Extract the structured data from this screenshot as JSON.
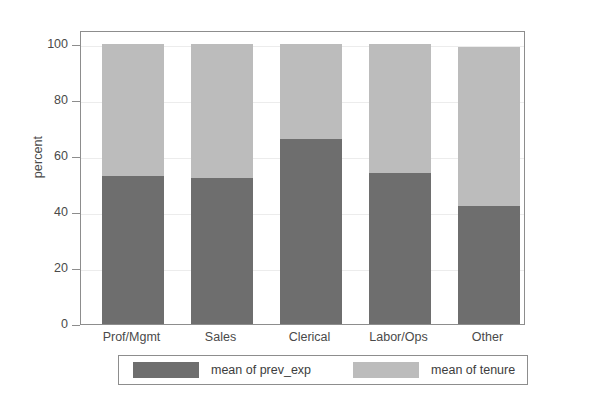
{
  "chart_data": {
    "type": "bar",
    "subtype": "stacked-percentage",
    "title": "",
    "xlabel": "",
    "ylabel": "percent",
    "ylim": [
      0,
      100
    ],
    "yticks": [
      0,
      20,
      40,
      60,
      80,
      100
    ],
    "ytick_labels": [
      "0",
      "20",
      "40",
      "60",
      "80",
      "100"
    ],
    "grid": true,
    "legend_position": "bottom",
    "categories": [
      "Prof/Mgmt",
      "Sales",
      "Clerical",
      "Labor/Ops",
      "Other"
    ],
    "series": [
      {
        "name": "mean of prev_exp",
        "color": "#6e6e6e",
        "values": [
          53,
          52,
          66,
          54,
          42
        ]
      },
      {
        "name": "mean of tenure",
        "color": "#bcbcbc",
        "values": [
          47,
          48,
          34,
          46,
          57
        ]
      }
    ]
  },
  "axes": {
    "y_title": "percent"
  },
  "legend": {
    "entries": [
      {
        "label": "mean of prev_exp",
        "color": "#6e6e6e"
      },
      {
        "label": "mean of tenure",
        "color": "#bcbcbc"
      }
    ]
  },
  "colors": {
    "series_dark": "#6e6e6e",
    "series_light": "#bcbcbc",
    "axis": "#8d8d8d",
    "grid": "#ececec",
    "text": "#4a4a4a",
    "background": "#ffffff"
  }
}
